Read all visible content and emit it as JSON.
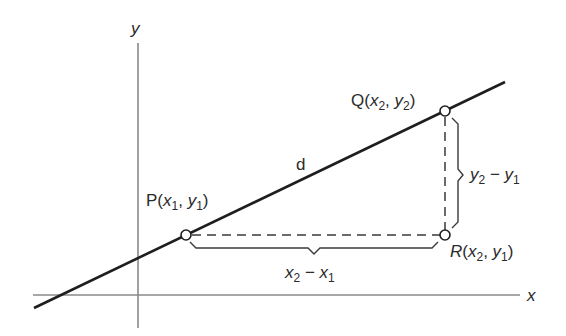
{
  "diagram": {
    "axes": {
      "x_label": "x",
      "y_label": "y",
      "color": "#8a8a8a"
    },
    "line": {
      "color": "#1e1e1e",
      "label": "d"
    },
    "points": {
      "P": {
        "name": "P",
        "open": "(",
        "x": "x",
        "x_sub": "1",
        "sep": ", ",
        "y": "y",
        "y_sub": "1",
        "close": ")"
      },
      "Q": {
        "name": "Q",
        "open": "(",
        "x": "x",
        "x_sub": "2",
        "sep": ", ",
        "y": "y",
        "y_sub": "2",
        "close": ")"
      },
      "R": {
        "name": "R",
        "open": "(",
        "x": "x",
        "x_sub": "2",
        "sep": ", ",
        "y": "y",
        "y_sub": "1",
        "close": ")"
      }
    },
    "horizontal_distance": {
      "a": "x",
      "a_sub": "2",
      "op": " − ",
      "b": "x",
      "b_sub": "1"
    },
    "vertical_distance": {
      "a": "y",
      "a_sub": "2",
      "op": " − ",
      "b": "y",
      "b_sub": "1"
    }
  }
}
